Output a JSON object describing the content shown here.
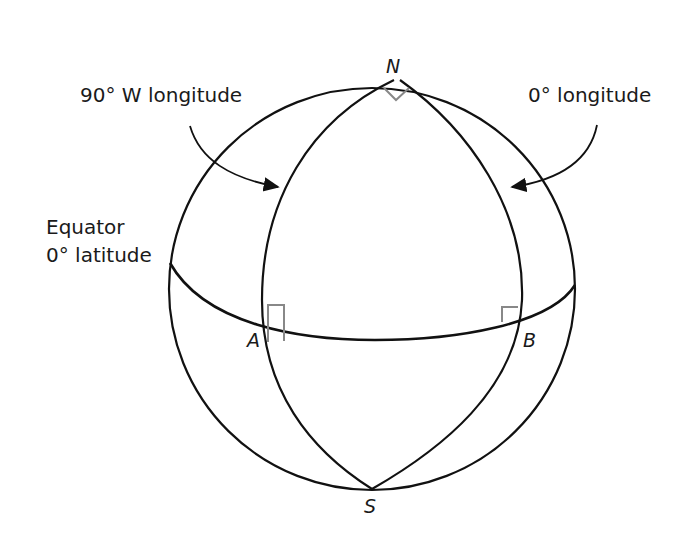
{
  "diagram": {
    "type": "sphere-with-great-circles",
    "labels": {
      "north": "N",
      "south": "S",
      "point_a": "A",
      "point_b": "B",
      "meridian_left": "90° W longitude",
      "meridian_right": "0° longitude",
      "equator_line1": "Equator",
      "equator_line2": "0° latitude"
    },
    "right_angle_markers": [
      "N",
      "A",
      "B"
    ],
    "colors": {
      "stroke": "#111111",
      "marker": "#888888",
      "background": "#ffffff"
    }
  }
}
